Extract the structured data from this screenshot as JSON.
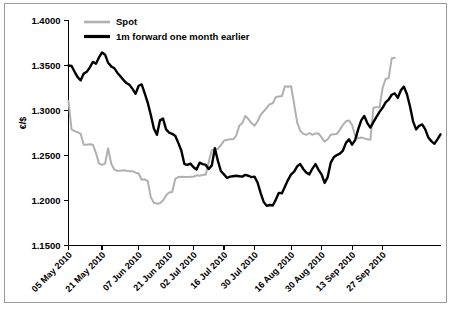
{
  "chart_data": {
    "type": "line",
    "title": "",
    "subtitle": "",
    "xlabel": "",
    "ylabel": "€/$",
    "ylim": [
      1.15,
      1.4
    ],
    "yticks": [
      1.15,
      1.2,
      1.25,
      1.3,
      1.35,
      1.4
    ],
    "ytick_labels": [
      "1.1500",
      "1.2000",
      "1.2500",
      "1.3000",
      "1.3500",
      "1.4000"
    ],
    "xtick_labels": [
      "05 May 2010",
      "21 May 2010",
      "07 Jun 2010",
      "21 Jun 2010",
      "02 Jul 2010",
      "16 Jul 2010",
      "30 Jul 2010",
      "16 Aug 2010",
      "30 Aug 2010",
      "13 Sep 2010",
      "27 Sep 2010"
    ],
    "xtick_indices": [
      0,
      11,
      23,
      33,
      41,
      51,
      61,
      73,
      83,
      93,
      103
    ],
    "grid": false,
    "legend_position": "top-left",
    "colors": {
      "spot": "#b0b0b0",
      "forward": "#000000",
      "axis": "#000000",
      "frame": "#9a9a9a",
      "background": "#ffffff"
    },
    "series": [
      {
        "name": "Spot",
        "color": "#b0b0b0",
        "values": [
          1.3105,
          1.279,
          1.277,
          1.276,
          1.274,
          1.262,
          1.262,
          1.2625,
          1.262,
          1.253,
          1.241,
          1.2395,
          1.241,
          1.258,
          1.241,
          1.2345,
          1.233,
          1.233,
          1.2335,
          1.233,
          1.2325,
          1.2325,
          1.231,
          1.23,
          1.223,
          1.2235,
          1.2215,
          1.2035,
          1.1975,
          1.1965,
          1.197,
          1.2,
          1.2055,
          1.209,
          1.2095,
          1.224,
          1.226,
          1.2265,
          1.226,
          1.226,
          1.2265,
          1.2265,
          1.228,
          1.2275,
          1.2285,
          1.2285,
          1.243,
          1.256,
          1.2565,
          1.2575,
          1.2615,
          1.2665,
          1.2675,
          1.268,
          1.268,
          1.272,
          1.283,
          1.286,
          1.294,
          1.2905,
          1.286,
          1.283,
          1.288,
          1.295,
          1.299,
          1.303,
          1.307,
          1.308,
          1.315,
          1.3155,
          1.316,
          1.327,
          1.3265,
          1.327,
          1.307,
          1.2865,
          1.2775,
          1.274,
          1.273,
          1.275,
          1.273,
          1.2745,
          1.2745,
          1.27,
          1.2655,
          1.268,
          1.273,
          1.2735,
          1.274,
          1.2785,
          1.284,
          1.288,
          1.289,
          1.284,
          1.272,
          1.269,
          1.27,
          1.269,
          1.268,
          1.2675,
          1.303,
          1.3035,
          1.3035,
          1.325,
          1.335,
          1.336,
          1.358,
          1.3585
        ]
      },
      {
        "name": "1m forward one month earlier",
        "color": "#000000",
        "values": [
          1.35,
          1.3495,
          1.343,
          1.337,
          1.3335,
          1.341,
          1.343,
          1.348,
          1.354,
          1.352,
          1.359,
          1.3645,
          1.362,
          1.353,
          1.349,
          1.347,
          1.342,
          1.338,
          1.334,
          1.3305,
          1.3285,
          1.324,
          1.3185,
          1.3275,
          1.329,
          1.319,
          1.3085,
          1.295,
          1.28,
          1.273,
          1.289,
          1.291,
          1.279,
          1.2755,
          1.274,
          1.272,
          1.264,
          1.2555,
          1.2405,
          1.2395,
          1.241,
          1.237,
          1.2345,
          1.242,
          1.2405,
          1.2395,
          1.235,
          1.239,
          1.258,
          1.244,
          1.2325,
          1.229,
          1.225,
          1.2265,
          1.227,
          1.2275,
          1.227,
          1.2265,
          1.2285,
          1.2275,
          1.226,
          1.2265,
          1.22,
          1.2085,
          1.1985,
          1.194,
          1.195,
          1.1945,
          1.201,
          1.2085,
          1.208,
          1.2155,
          1.223,
          1.229,
          1.232,
          1.238,
          1.2405,
          1.235,
          1.231,
          1.229,
          1.2355,
          1.2405,
          1.234,
          1.229,
          1.2195,
          1.226,
          1.242,
          1.248,
          1.2505,
          1.252,
          1.2555,
          1.264,
          1.268,
          1.262,
          1.267,
          1.279,
          1.289,
          1.294,
          1.286,
          1.281,
          1.287,
          1.293,
          1.2985,
          1.303,
          1.309,
          1.312,
          1.3175,
          1.319,
          1.314,
          1.3225,
          1.3265,
          1.318,
          1.3045,
          1.288,
          1.279,
          1.283,
          1.2845,
          1.279,
          1.27,
          1.266,
          1.263,
          1.268,
          1.2735
        ]
      }
    ]
  },
  "legend": {
    "entries": [
      {
        "label": "Spot",
        "color": "#b0b0b0"
      },
      {
        "label": "1m forward one month earlier",
        "color": "#000000"
      }
    ]
  },
  "axes": {
    "y_title": "€/$"
  }
}
